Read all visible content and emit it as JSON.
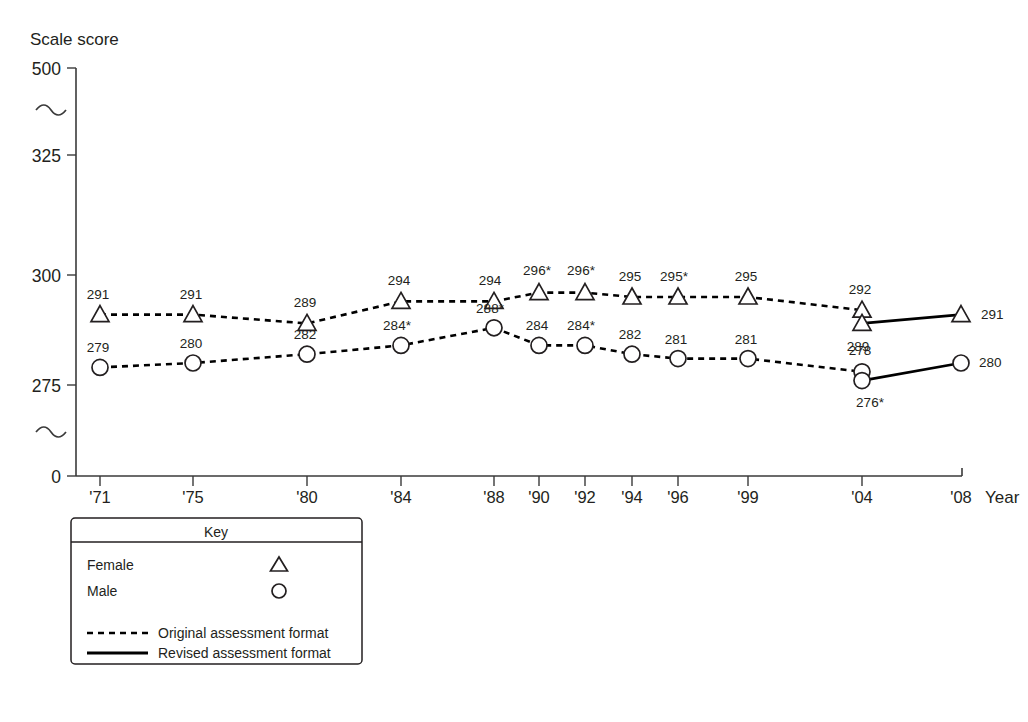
{
  "chart_data": {
    "type": "line",
    "title": "",
    "ylabel": "Scale score",
    "xlabel": "Year",
    "grid": false,
    "legend_position": "bottom-left",
    "ylim": [
      0,
      500
    ],
    "y_ticks": [
      "0",
      "275",
      "300",
      "325",
      "500"
    ],
    "axis_breaks": 2,
    "categories": [
      "'71",
      "'75",
      "'80",
      "'84",
      "'88",
      "'90",
      "'92",
      "'94",
      "'96",
      "'99",
      "'04",
      "'08"
    ],
    "series": [
      {
        "name": "Female",
        "marker": "triangle",
        "format": "Original assessment format",
        "line_style": "dashed",
        "x": [
          "'71",
          "'75",
          "'80",
          "'84",
          "'88",
          "'90",
          "'92",
          "'94",
          "'96",
          "'99",
          "'04"
        ],
        "values": [
          291,
          291,
          289,
          294,
          294,
          296,
          296,
          295,
          295,
          295,
          292
        ],
        "labels": [
          "291",
          "291",
          "289",
          "294",
          "294",
          "296*",
          "296*",
          "295",
          "295*",
          "295",
          "292"
        ],
        "significant": [
          false,
          false,
          false,
          false,
          false,
          true,
          true,
          false,
          true,
          false,
          false
        ]
      },
      {
        "name": "Female",
        "marker": "triangle",
        "format": "Revised assessment format",
        "line_style": "solid",
        "x": [
          "'04",
          "'08"
        ],
        "values": [
          289,
          291
        ],
        "labels": [
          "289",
          "291"
        ],
        "significant": [
          false,
          false
        ]
      },
      {
        "name": "Male",
        "marker": "circle",
        "format": "Original assessment format",
        "line_style": "dashed",
        "x": [
          "'71",
          "'75",
          "'80",
          "'84",
          "'88",
          "'90",
          "'92",
          "'94",
          "'96",
          "'99",
          "'04"
        ],
        "values": [
          279,
          280,
          282,
          284,
          288,
          284,
          284,
          282,
          281,
          281,
          278
        ],
        "labels": [
          "279",
          "280",
          "282",
          "284*",
          "288*",
          "284",
          "284*",
          "282",
          "281",
          "281",
          "278"
        ],
        "significant": [
          false,
          false,
          false,
          true,
          true,
          false,
          true,
          false,
          false,
          false,
          false
        ]
      },
      {
        "name": "Male",
        "marker": "circle",
        "format": "Revised assessment format",
        "line_style": "solid",
        "x": [
          "'04",
          "'08"
        ],
        "values": [
          276,
          280
        ],
        "labels": [
          "276*",
          "280"
        ],
        "significant": [
          true,
          false
        ]
      }
    ]
  },
  "key": {
    "title": "Key",
    "marker_items": [
      {
        "label": "Female",
        "marker": "triangle"
      },
      {
        "label": "Male",
        "marker": "circle"
      }
    ],
    "line_items": [
      {
        "label": "Original assessment format",
        "style": "dashed"
      },
      {
        "label": "Revised assessment format",
        "style": "solid"
      }
    ]
  }
}
